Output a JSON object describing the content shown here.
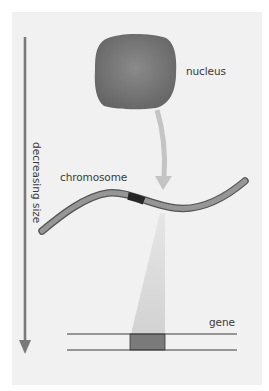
{
  "figure": {
    "labels": {
      "nucleus": "nucleus",
      "chromosome": "chromosome",
      "gene": "gene",
      "axis": "decreasing size"
    },
    "colors": {
      "background": "#f1f1f1",
      "nucleus_fill": "#727272",
      "arrow": "#7a7a7a",
      "curved_arrow": "#c4c4c4",
      "chromosome_fill": "#8a8a8a",
      "chromosome_band": "#2a2a2a",
      "cone": "#d9d9d9",
      "gene_fill": "#7a7a7a",
      "dna_line": "#3a3a3a"
    }
  }
}
